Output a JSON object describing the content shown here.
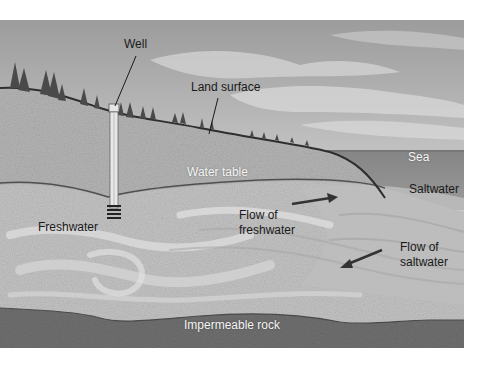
{
  "diagram": {
    "type": "cross-section",
    "labels": {
      "well": "Well",
      "land_surface": "Land surface",
      "water_table": "Water table",
      "sea": "Sea",
      "saltwater": "Saltwater",
      "freshwater": "Freshwater",
      "flow_freshwater_line1": "Flow of",
      "flow_freshwater_line2": "freshwater",
      "flow_saltwater_line1": "Flow of",
      "flow_saltwater_line2": "saltwater",
      "impermeable_rock": "Impermeable rock"
    },
    "arrows": [
      {
        "name": "freshwater-flow-arrow",
        "direction": "right (toward sea)"
      },
      {
        "name": "saltwater-flow-arrow",
        "direction": "left (inland)"
      }
    ],
    "colors": {
      "sky": "#a9a9a9",
      "cloud": "#d6d6d6",
      "sea": "#8a8a8a",
      "land": "#b4b4b4",
      "aquifer": "#c2c2c2",
      "aquifer_swirl": "#dadada",
      "rock": "#6e6e6e",
      "outline": "#3a3a3a",
      "trees": "#4a4a4a"
    }
  }
}
